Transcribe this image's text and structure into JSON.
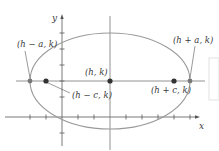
{
  "diagram": {
    "type": "ellipse-horizontal-major-axis",
    "axes": {
      "x_label": "x",
      "y_label": "y"
    },
    "points": {
      "center": {
        "label": "(h, k)"
      },
      "vertex_left": {
        "label": "(h − a, k)"
      },
      "vertex_right": {
        "label": "(h + a, k)"
      },
      "focus_left": {
        "label": "(h − c, k)"
      },
      "focus_right": {
        "label": "(h + c, k)"
      }
    },
    "colors": {
      "ellipse": "#9a9a9a",
      "axes": "#555555",
      "points": "#333333",
      "vertex_points": "#777777"
    }
  }
}
